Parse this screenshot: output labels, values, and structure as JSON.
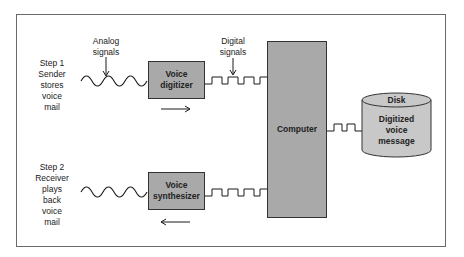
{
  "step1": {
    "lines": [
      "Step 1",
      "Sender",
      "stores",
      "voice",
      "mail"
    ]
  },
  "step2": {
    "lines": [
      "Step 2",
      "Receiver",
      "plays",
      "back",
      "voice",
      "mail"
    ]
  },
  "labels": {
    "analog": [
      "Analog",
      "signals"
    ],
    "digital": [
      "Digital",
      "signals"
    ]
  },
  "boxes": {
    "digitizer": [
      "Voice",
      "digitizer"
    ],
    "synthesizer": [
      "Voice",
      "synthesizer"
    ],
    "computer": "Computer"
  },
  "disk": {
    "title": "Disk",
    "content": [
      "Digitized",
      "voice",
      "message"
    ]
  },
  "arrows": {
    "top_direction": "right",
    "bottom_direction": "left"
  },
  "colors": {
    "box_fill": "#a9a9a9",
    "disk_fill": "#c8c8c8",
    "line": "#1a1a1a"
  }
}
